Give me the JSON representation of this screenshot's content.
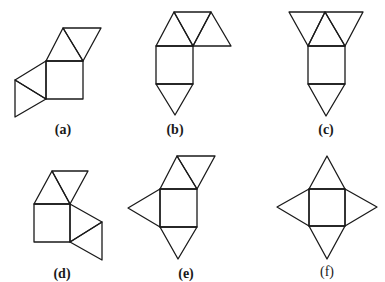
{
  "figure": {
    "nets": [
      {
        "id": "a",
        "label": "(a)",
        "bold": true
      },
      {
        "id": "b",
        "label": "(b)",
        "bold": true
      },
      {
        "id": "c",
        "label": "(c)",
        "bold": true
      },
      {
        "id": "d",
        "label": "(d)",
        "bold": true
      },
      {
        "id": "e",
        "label": "(e)",
        "bold": true
      },
      {
        "id": "f",
        "label": "(f)",
        "bold": false
      }
    ],
    "colors": {
      "line": "#1a1a1a",
      "background": "#ffffff"
    }
  }
}
